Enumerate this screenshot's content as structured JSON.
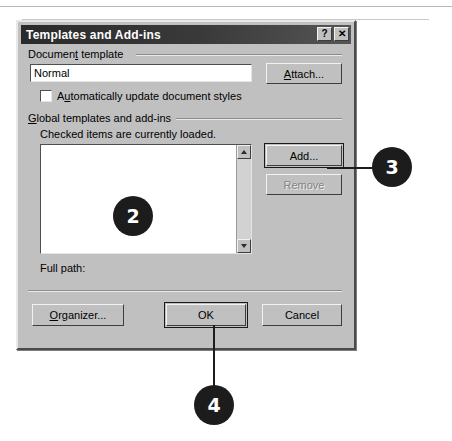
{
  "dialog": {
    "title": "Templates and Add-ins",
    "title_buttons": [
      {
        "name": "help-button",
        "glyph": "?"
      },
      {
        "name": "close-button",
        "glyph": "✕"
      }
    ],
    "document_template": {
      "group_label": "Document template",
      "group_label_underline": "t",
      "template_value": "Normal",
      "attach_button": "Attach...",
      "attach_underline": "A",
      "auto_update_checkbox": {
        "label": "Automatically update document styles",
        "underline": "u",
        "checked": false
      }
    },
    "global_templates": {
      "group_label": "Global templates and add-ins",
      "group_label_underline": "G",
      "hint": "Checked items are currently loaded.",
      "items": [],
      "add_button": "Add...",
      "remove_button": "Remove",
      "remove_disabled": true,
      "scrollbar": {
        "up_icon": "arrow-up-icon",
        "down_icon": "arrow-down-icon"
      }
    },
    "full_path_label": "Full path:",
    "full_path_value": "",
    "footer_buttons": {
      "organizer": "Organizer...",
      "organizer_underline": "O",
      "ok": "OK",
      "cancel": "Cancel"
    }
  },
  "callouts": [
    {
      "number": "2",
      "target": "global-templates-listbox"
    },
    {
      "number": "3",
      "target": "add-button"
    },
    {
      "number": "4",
      "target": "ok-button"
    }
  ],
  "colors": {
    "dialog_face": "#c0c0c0",
    "titlebar": "#2a2a2a",
    "callout": "#1c1c1c",
    "field_bg": "#ffffff"
  }
}
